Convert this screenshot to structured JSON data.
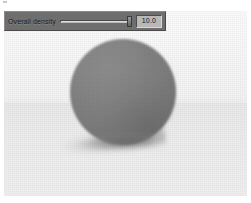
{
  "window": {
    "title": "Overall density"
  },
  "viewport": {
    "name": "3d-render-viewport",
    "description": "Rendered gray sphere resting on a light ground plane with a soft cast shadow",
    "background_color": "#f4f4f4",
    "ground_color": "#ededed",
    "sphere_color": "#7e7e7e",
    "shadow_color": "#8c8c8c"
  },
  "control_panel": {
    "slider": {
      "label": "Overall density",
      "value": "10.0",
      "fill_percent": 100,
      "track_color": "#dcdcdc",
      "panel_color": "#6e6e6e"
    }
  }
}
